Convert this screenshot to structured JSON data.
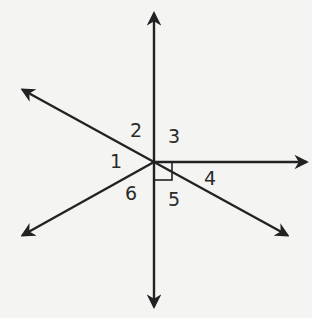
{
  "diagram": {
    "vertex": {
      "x": 154,
      "y": 162
    },
    "rays": [
      {
        "name": "up",
        "tip": {
          "x": 154,
          "y": 14
        }
      },
      {
        "name": "right",
        "tip": {
          "x": 306,
          "y": 162
        }
      },
      {
        "name": "lower-right",
        "tip": {
          "x": 287,
          "y": 235
        }
      },
      {
        "name": "down",
        "tip": {
          "x": 154,
          "y": 306
        }
      },
      {
        "name": "lower-left",
        "tip": {
          "x": 23,
          "y": 235
        }
      },
      {
        "name": "upper-left",
        "tip": {
          "x": 23,
          "y": 90
        }
      }
    ],
    "angle_labels": [
      {
        "text": "1",
        "x": 110,
        "y": 168
      },
      {
        "text": "2",
        "x": 130,
        "y": 137
      },
      {
        "text": "3",
        "x": 168,
        "y": 143
      },
      {
        "text": "4",
        "x": 204,
        "y": 185
      },
      {
        "text": "5",
        "x": 168,
        "y": 206
      },
      {
        "text": "6",
        "x": 125,
        "y": 200
      }
    ],
    "right_angle_marker": {
      "x": 154,
      "y": 162,
      "size": 18
    },
    "line_color": "#222222",
    "background_color": "#f4f4f2"
  }
}
